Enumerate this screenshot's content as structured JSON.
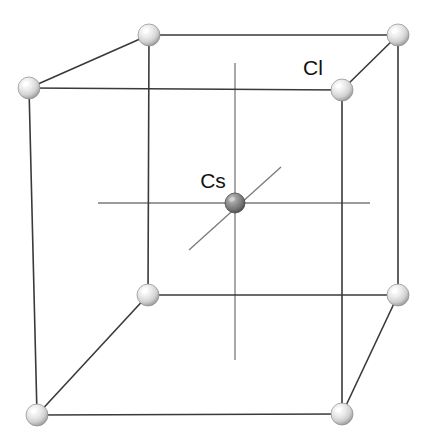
{
  "figure": {
    "name": "cscl-unit-cell-diagram",
    "background_color": "#ffffff",
    "width": 434,
    "height": 447
  },
  "labels": [
    {
      "id": "label-cl",
      "text": "Cl",
      "x": 313,
      "y": 75,
      "anchor": "middle",
      "color": "#111111"
    },
    {
      "id": "label-cs",
      "text": "Cs",
      "x": 213,
      "y": 188,
      "anchor": "middle",
      "color": "#111111"
    }
  ],
  "atoms": {
    "corner": {
      "species": "Cl",
      "radius": 11,
      "fill_center": "#ffffff",
      "fill_mid": "#e2e2e2",
      "fill_edge": "#9a9a9a",
      "outline": "#8c8c8c",
      "count": 8,
      "positions": [
        {
          "id": "corner-back-top-left",
          "x": 149,
          "y": 35
        },
        {
          "id": "corner-back-top-right",
          "x": 398,
          "y": 35
        },
        {
          "id": "corner-front-top-left",
          "x": 29,
          "y": 88
        },
        {
          "id": "corner-front-top-right",
          "x": 342,
          "y": 90
        },
        {
          "id": "corner-back-bottom-left",
          "x": 148,
          "y": 295
        },
        {
          "id": "corner-back-bottom-right",
          "x": 398,
          "y": 295
        },
        {
          "id": "corner-front-bottom-left",
          "x": 37,
          "y": 415
        },
        {
          "id": "corner-front-bottom-right",
          "x": 342,
          "y": 414
        }
      ]
    },
    "center": {
      "species": "Cs",
      "radius": 10,
      "fill_center": "#b4b4b4",
      "fill_mid": "#808080",
      "fill_edge": "#4a4a4a",
      "outline": "#3c3c3c",
      "count": 1,
      "positions": [
        {
          "id": "center-cs",
          "x": 235,
          "y": 203
        }
      ]
    }
  },
  "cube_edges": {
    "stroke": "#3a3a3a",
    "stroke_width": 1.6,
    "segments": [
      {
        "id": "edge-top-back",
        "x1": 149,
        "y1": 35,
        "x2": 398,
        "y2": 35
      },
      {
        "id": "edge-top-left-depth",
        "x1": 149,
        "y1": 35,
        "x2": 29,
        "y2": 88
      },
      {
        "id": "edge-top-right-depth",
        "x1": 398,
        "y1": 35,
        "x2": 342,
        "y2": 90
      },
      {
        "id": "edge-top-front",
        "x1": 29,
        "y1": 88,
        "x2": 342,
        "y2": 90
      },
      {
        "id": "edge-vert-back-left",
        "x1": 149,
        "y1": 35,
        "x2": 148,
        "y2": 295
      },
      {
        "id": "edge-vert-back-right",
        "x1": 398,
        "y1": 35,
        "x2": 398,
        "y2": 295
      },
      {
        "id": "edge-vert-front-left",
        "x1": 29,
        "y1": 88,
        "x2": 37,
        "y2": 415
      },
      {
        "id": "edge-vert-front-right",
        "x1": 342,
        "y1": 90,
        "x2": 342,
        "y2": 414
      },
      {
        "id": "edge-bottom-back",
        "x1": 148,
        "y1": 295,
        "x2": 398,
        "y2": 295
      },
      {
        "id": "edge-bottom-left-depth",
        "x1": 148,
        "y1": 295,
        "x2": 37,
        "y2": 415
      },
      {
        "id": "edge-bottom-right-depth",
        "x1": 398,
        "y1": 295,
        "x2": 342,
        "y2": 414
      },
      {
        "id": "edge-bottom-front",
        "x1": 37,
        "y1": 415,
        "x2": 342,
        "y2": 414
      }
    ]
  },
  "coordination_axes": {
    "stroke": "#7a7a7a",
    "stroke_width": 1.3,
    "segments": [
      {
        "id": "axis-horizontal",
        "x1": 98,
        "y1": 203,
        "x2": 370,
        "y2": 203
      },
      {
        "id": "axis-vertical",
        "x1": 235,
        "y1": 63,
        "x2": 235,
        "y2": 360
      },
      {
        "id": "axis-diagonal",
        "x1": 189,
        "y1": 250,
        "x2": 281,
        "y2": 167
      }
    ]
  }
}
